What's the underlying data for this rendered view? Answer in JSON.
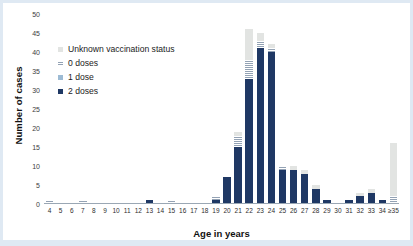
{
  "figure": {
    "ylabel": "Number of cases",
    "xlabel": "Age in years"
  },
  "legend": {
    "items": [
      {
        "label": "Unknown vaccination status",
        "key": "unknown",
        "color": "#e2e4e2"
      },
      {
        "label": "0 doses",
        "key": "dose0",
        "color": "#b9c4cf"
      },
      {
        "label": "1 dose",
        "key": "dose1",
        "color": "#9dbbd4"
      },
      {
        "label": "2 doses",
        "key": "dose2",
        "color": "#1f3864"
      }
    ]
  },
  "chart_data": {
    "type": "bar",
    "subtype": "stacked",
    "title": "",
    "xlabel": "Age in years",
    "ylabel": "Number of cases",
    "ylim": [
      0,
      50
    ],
    "yticks": [
      0,
      5,
      10,
      15,
      20,
      25,
      30,
      35,
      40,
      45,
      50
    ],
    "grid": false,
    "legend_position": "upper-left",
    "categories": [
      "4",
      "5",
      "6",
      "7",
      "8",
      "9",
      "10",
      "11",
      "12",
      "13",
      "14",
      "15",
      "16",
      "17",
      "18",
      "19",
      "20",
      "21",
      "22",
      "23",
      "24",
      "25",
      "26",
      "27",
      "28",
      "29",
      "30",
      "31",
      "32",
      "33",
      "34",
      "≥35"
    ],
    "series": [
      {
        "name": "2 doses",
        "color": "#1f3864",
        "values": [
          0,
          0,
          0,
          0,
          0,
          0,
          0,
          0,
          0,
          1,
          0,
          0,
          0,
          0,
          0,
          1,
          7,
          15,
          33,
          41,
          40,
          9,
          9,
          8,
          4,
          1,
          0,
          1,
          2,
          3,
          1,
          0
        ]
      },
      {
        "name": "1 dose",
        "color": "#9dbbd4",
        "values": [
          0,
          0,
          0,
          0,
          0,
          0,
          0,
          0,
          0,
          0,
          0,
          0,
          0,
          0,
          0,
          0,
          0,
          0,
          0,
          0,
          0,
          0,
          0,
          0,
          0,
          0,
          0,
          0,
          0,
          0,
          0,
          0
        ]
      },
      {
        "name": "0 doses",
        "color": "#b9c4cf",
        "values": [
          1,
          0,
          0,
          1,
          0,
          0,
          0,
          0,
          0,
          0,
          0,
          1,
          0,
          0,
          0,
          1,
          0,
          3,
          5,
          2,
          1,
          1,
          0,
          0,
          0,
          0,
          0,
          0,
          0,
          0,
          0,
          2
        ]
      },
      {
        "name": "Unknown vaccination status",
        "color": "#e2e4e2",
        "values": [
          0,
          0,
          0,
          0,
          0,
          0,
          0,
          0,
          0,
          0,
          0,
          0,
          0,
          0,
          0,
          0,
          0,
          1,
          8,
          2,
          1,
          0,
          1,
          1,
          1,
          0,
          0,
          0,
          1,
          1,
          0,
          14
        ]
      }
    ],
    "totals": [
      1,
      0,
      0,
      1,
      0,
      0,
      0,
      0,
      0,
      1,
      0,
      1,
      0,
      0,
      0,
      2,
      7,
      19,
      46,
      45,
      42,
      10,
      10,
      9,
      5,
      1,
      0,
      1,
      3,
      4,
      1,
      16
    ]
  }
}
